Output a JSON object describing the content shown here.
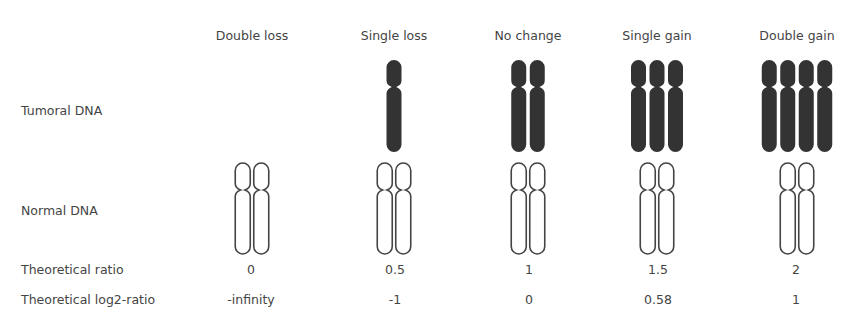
{
  "diagram": {
    "columns": [
      {
        "key": "double_loss",
        "label": "Double loss",
        "center_x": 252,
        "tumoral_count": 0,
        "normal_count": 2,
        "theoretical_ratio": "0",
        "theoretical_log2_ratio": "-infinity"
      },
      {
        "key": "single_loss",
        "label": "Single loss",
        "center_x": 394,
        "tumoral_count": 1,
        "normal_count": 2,
        "theoretical_ratio": "0.5",
        "theoretical_log2_ratio": "-1"
      },
      {
        "key": "no_change",
        "label": "No change",
        "center_x": 528,
        "tumoral_count": 2,
        "normal_count": 2,
        "theoretical_ratio": "1",
        "theoretical_log2_ratio": "0"
      },
      {
        "key": "single_gain",
        "label": "Single gain",
        "center_x": 657,
        "tumoral_count": 3,
        "normal_count": 2,
        "theoretical_ratio": "1.5",
        "theoretical_log2_ratio": "0.58"
      },
      {
        "key": "double_gain",
        "label": "Double gain",
        "center_x": 797,
        "tumoral_count": 4,
        "normal_count": 2,
        "theoretical_ratio": "2",
        "theoretical_log2_ratio": "1"
      }
    ],
    "rows": {
      "tumoral_dna": "Tumoral DNA",
      "normal_dna": "Normal DNA",
      "theoretical_ratio": "Theoretical ratio",
      "theoretical_log2_ratio": "Theoretical log2-ratio"
    },
    "colors": {
      "text": "#444444",
      "tumoral_fill": "#333333",
      "normal_stroke": "#444444",
      "background": "#ffffff"
    },
    "chromosome_geometry": {
      "width": 15,
      "gap": 3.5,
      "tumoral": {
        "top": 60,
        "centromere": 87,
        "bottom": 152
      },
      "normal": {
        "top": 163,
        "centromere": 190,
        "bottom": 254
      }
    }
  }
}
